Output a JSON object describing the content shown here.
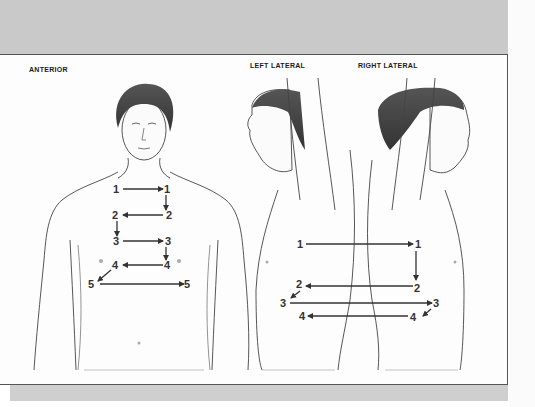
{
  "figure": {
    "views": [
      {
        "id": "anterior",
        "label": "Anterior"
      },
      {
        "id": "left_lateral",
        "label": "Left lateral"
      },
      {
        "id": "right_lateral",
        "label": "Right lateral"
      }
    ],
    "anterior_points": [
      {
        "n": "1",
        "left": "1",
        "right": "1"
      },
      {
        "n": "2",
        "left": "2",
        "right": "2"
      },
      {
        "n": "3",
        "left": "3",
        "right": "3"
      },
      {
        "n": "4",
        "left": "4",
        "right": "4"
      },
      {
        "n": "5",
        "left": "5",
        "right": "5"
      }
    ],
    "lateral_points": [
      {
        "n": "1",
        "left": "1",
        "right": "1"
      },
      {
        "n": "2",
        "left": "2",
        "right": "2"
      },
      {
        "n": "3",
        "left": "3",
        "right": "3"
      },
      {
        "n": "4",
        "left": "4",
        "right": "4"
      }
    ],
    "colors": {
      "band": "#c9c9c9",
      "panel": "#fdfdfd",
      "border": "#555555",
      "arrow": "#333333"
    }
  }
}
